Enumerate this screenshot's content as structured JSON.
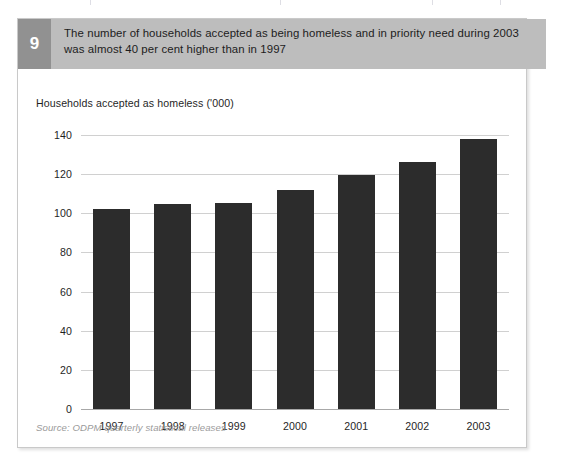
{
  "figure": {
    "number": "9",
    "caption": "The number of households accepted as being homeless and in priority need during 2003 was almost 40 per cent higher than in 1997",
    "source": "Source: ODPM quarterly statistical releases",
    "colors": {
      "header_band": "#bdbdbd",
      "number_badge": "#919191",
      "bar": "#2c2c2c",
      "gridline": "#d0d0d0",
      "card_border": "#c9c9c9"
    }
  },
  "chart_data": {
    "type": "bar",
    "title": "",
    "ylabel": "Households accepted as homeless ('000)",
    "xlabel": "",
    "categories": [
      "1997",
      "1998",
      "1999",
      "2000",
      "2001",
      "2002",
      "2003"
    ],
    "values": [
      102,
      105,
      105.5,
      112,
      119.5,
      126,
      138
    ],
    "ylim": [
      0,
      140
    ],
    "yticks": [
      0,
      20,
      40,
      60,
      80,
      100,
      120,
      140
    ],
    "ytick_labels": [
      "0",
      "20",
      "40",
      "60",
      "80",
      "100",
      "120",
      "140"
    ],
    "grid": true,
    "legend": false,
    "legend_position": "none",
    "series": [
      {
        "name": "Households accepted as homeless ('000)",
        "values": [
          102,
          105,
          105.5,
          112,
          119.5,
          126,
          138
        ]
      }
    ]
  }
}
